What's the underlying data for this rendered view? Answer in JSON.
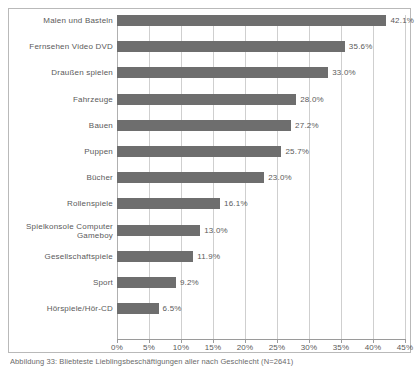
{
  "chart_data": {
    "type": "bar",
    "orientation": "horizontal",
    "title": "",
    "subtitle": "",
    "xlabel": "",
    "ylabel": "",
    "xlim": [
      0,
      45
    ],
    "grid": true,
    "legend": false,
    "categories": [
      "Malen und Basteln",
      "Fernsehen  Video  DVD",
      "Draußen spielen",
      "Fahrzeuge",
      "Bauen",
      "Puppen",
      "Bücher",
      "Rollenspiele",
      "Spielkonsole  Computer\nGameboy",
      "Gesellschaftspiele",
      "Sport",
      "Hörspiele/Hör-CD"
    ],
    "values": [
      42.1,
      35.6,
      33.0,
      28.0,
      27.2,
      25.7,
      23.0,
      16.1,
      13.0,
      11.9,
      9.2,
      6.5
    ],
    "value_labels": [
      "42.1%",
      "35.6%",
      "33.0%",
      "28.0%",
      "27.2%",
      "25.7%",
      "23.0%",
      "16.1%",
      "13.0%",
      "11.9%",
      "9.2%",
      "6.5%"
    ],
    "xticks": [
      0,
      5,
      10,
      15,
      20,
      25,
      30,
      35,
      40,
      45
    ],
    "xtick_labels": [
      "0%",
      "5%",
      "10%",
      "15%",
      "20%",
      "25%",
      "30%",
      "35%",
      "40%",
      "45%"
    ],
    "bar_color": "#6e6e6e",
    "grid_color": "#cfcfcf",
    "frame_color": "#b9b9b9",
    "text_color": "#5a5a5a"
  },
  "caption": {
    "text": "Abbildung   33:  Bliebteste Lieblingsbeschäftigungen aller nach Geschlecht (N=2641)"
  }
}
